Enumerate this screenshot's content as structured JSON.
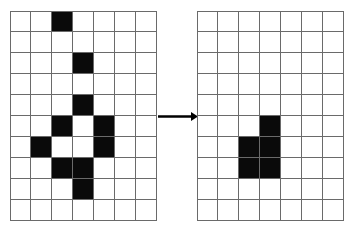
{
  "figure": {
    "name": "cellular-automaton-transformation",
    "colors": {
      "background": "#ffffff",
      "grid_line": "#6a6a6a",
      "filled_cell": "#0a0a0a",
      "arrow": "#000000"
    }
  },
  "grids": [
    {
      "name": "left-grid",
      "label": "before",
      "columns": 7,
      "rows": 10,
      "cell_size": 21,
      "filled_cells": [
        [
          0,
          2
        ],
        [
          2,
          3
        ],
        [
          4,
          3
        ],
        [
          5,
          2
        ],
        [
          5,
          4
        ],
        [
          6,
          1
        ],
        [
          6,
          4
        ],
        [
          7,
          2
        ],
        [
          7,
          3
        ],
        [
          8,
          3
        ]
      ],
      "filled_count": 10
    },
    {
      "name": "right-grid",
      "label": "after",
      "columns": 7,
      "rows": 10,
      "cell_size": 21,
      "filled_cells": [
        [
          5,
          3
        ],
        [
          6,
          2
        ],
        [
          6,
          3
        ],
        [
          7,
          2
        ],
        [
          7,
          3
        ]
      ],
      "filled_count": 5
    }
  ],
  "arrow": {
    "name": "transformation-arrow",
    "direction": "right",
    "label": ""
  }
}
